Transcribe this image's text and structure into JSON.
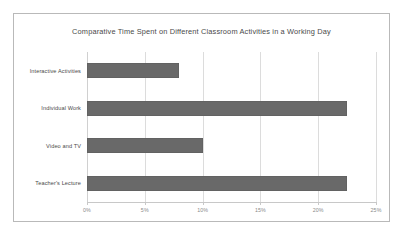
{
  "chart_data": {
    "type": "bar",
    "orientation": "horizontal",
    "title": "Comparative Time Spent on Different Classroom Activities in a Working Day",
    "xlabel": "",
    "ylabel": "",
    "categories": [
      "Interactive Activities",
      "Individual Work",
      "Video and TV",
      "Teacher's Lecture"
    ],
    "values": [
      8,
      22.5,
      10,
      22.5
    ],
    "value_suffix": "%",
    "xlim": [
      0,
      25
    ],
    "xticks": [
      0,
      5,
      10,
      15,
      20,
      25
    ],
    "xticklabels": [
      "0%",
      "5%",
      "10%",
      "15%",
      "20%",
      "25%"
    ],
    "grid": true,
    "grid_axis": "x",
    "legend": false,
    "series": [
      {
        "name": "Time Spent",
        "values": [
          8,
          22.5,
          10,
          22.5
        ],
        "color": "#696969"
      }
    ],
    "colors": {
      "bar": "#696969",
      "gridline": "#dcdcdc",
      "axis": "#c8c8c8",
      "title_text": "#4a4a4a",
      "category_text": "#4a4a4a",
      "tick_text": "#8a8a8a",
      "frame_border": "#b9b9b9",
      "background": "#ffffff"
    }
  }
}
